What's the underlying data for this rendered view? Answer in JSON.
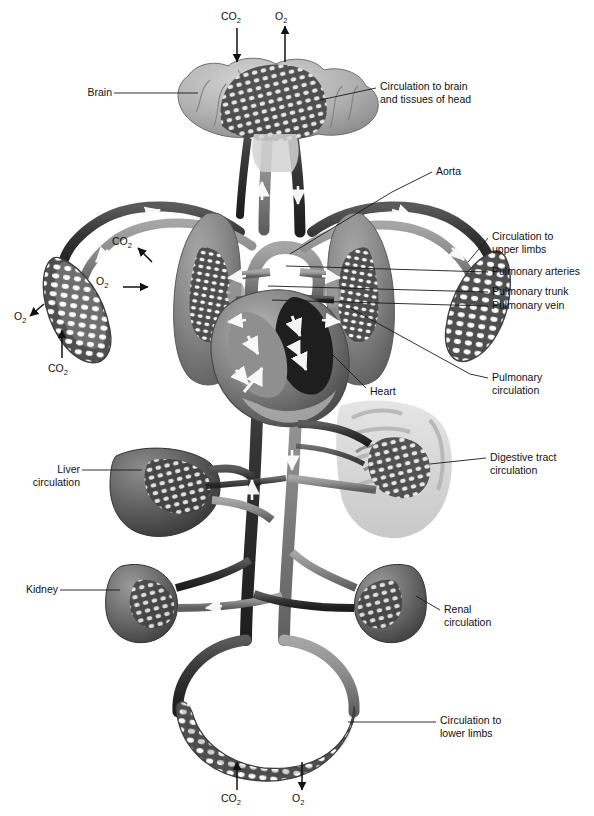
{
  "figure": {
    "style": "grayscale anatomical illustration",
    "colors": {
      "background": "#ffffff",
      "artery_vessel": "#8d8d8d",
      "vein_vessel": "#3a3a3a",
      "organ_mid": "#8a8a8a",
      "organ_dark": "#4a4a4a",
      "organ_light": "#c8c8c8",
      "leader_line": "#1a1a1a",
      "flow_arrow": "#ffffff",
      "text": "#111111"
    }
  },
  "labels": {
    "brain": "Brain",
    "circulation_head": "Circulation to brain\nand tissues of head",
    "aorta": "Aorta",
    "circulation_upper_limbs": "Circulation to\nupper limbs",
    "pulmonary_arteries": "Pulmonary arteries",
    "pulmonary_trunk": "Pulmonary trunk",
    "pulmonary_vein": "Pulmonary vein",
    "pulmonary_circulation": "Pulmonary\ncirculation",
    "heart": "Heart",
    "digestive_tract_circulation": "Digestive tract\ncirculation",
    "liver_circulation": "Liver\ncirculation",
    "kidney": "Kidney",
    "renal_circulation": "Renal\ncirculation",
    "circulation_lower_limbs": "Circulation to\nlower limbs"
  },
  "gas_labels": {
    "head_co2": "CO",
    "head_co2_sub": "2",
    "head_o2": "O",
    "head_o2_sub": "2",
    "lung_co2": "CO",
    "lung_co2_sub": "2",
    "lung_o2": "O",
    "lung_o2_sub": "2",
    "arm_o2": "O",
    "arm_o2_sub": "2",
    "arm_co2": "CO",
    "arm_co2_sub": "2",
    "leg_co2": "CO",
    "leg_co2_sub": "2",
    "leg_o2": "O",
    "leg_o2_sub": "2"
  },
  "gas_exchange": [
    {
      "region": "head",
      "gas": "CO2",
      "direction": "in-to-lungs-arrow-down"
    },
    {
      "region": "head",
      "gas": "O2",
      "direction": "out-arrow-up"
    },
    {
      "region": "lungs",
      "gas": "CO2",
      "direction": "out-arrow-up-left"
    },
    {
      "region": "lungs",
      "gas": "O2",
      "direction": "in-arrow-right"
    },
    {
      "region": "upper-limb",
      "gas": "O2",
      "direction": "out-arrow-down-left"
    },
    {
      "region": "upper-limb",
      "gas": "CO2",
      "direction": "in-arrow-up"
    },
    {
      "region": "lower-limb",
      "gas": "CO2",
      "direction": "out-arrow-up"
    },
    {
      "region": "lower-limb",
      "gas": "O2",
      "direction": "in-arrow-down"
    }
  ],
  "organs": [
    {
      "name": "brain",
      "label": "Brain"
    },
    {
      "name": "left-lung",
      "label": "Lung"
    },
    {
      "name": "right-lung",
      "label": "Lung"
    },
    {
      "name": "heart",
      "label": "Heart"
    },
    {
      "name": "liver",
      "label": "Liver"
    },
    {
      "name": "digestive-tract",
      "label": "Digestive tract"
    },
    {
      "name": "left-kidney",
      "label": "Kidney"
    },
    {
      "name": "right-kidney",
      "label": "Kidney"
    },
    {
      "name": "upper-limb-capillary-bed-left",
      "label": "Upper limb capillaries"
    },
    {
      "name": "upper-limb-capillary-bed-right",
      "label": "Upper limb capillaries"
    },
    {
      "name": "lower-limb-capillary-bed",
      "label": "Lower limb capillaries"
    }
  ]
}
